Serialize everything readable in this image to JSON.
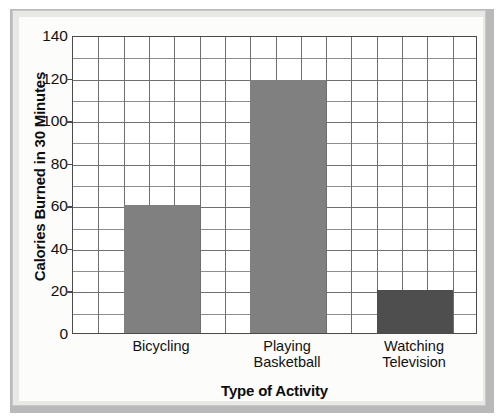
{
  "chart_data": {
    "type": "bar",
    "title": "",
    "subtitle": "",
    "categories": [
      "Bicycling",
      "Playing Basketball",
      "Watching Television"
    ],
    "category_lines": [
      [
        "Bicycling"
      ],
      [
        "Playing",
        "Basketball"
      ],
      [
        "Watching",
        "Television"
      ]
    ],
    "values": [
      60,
      119,
      20
    ],
    "xlabel": "Type of Activity",
    "ylabel": "Calories Burned in 30 Minutes",
    "ylim": [
      0,
      140
    ],
    "ytick_labels": [
      "0",
      "20",
      "40",
      "60",
      "80",
      "100",
      "120",
      "140"
    ],
    "ytick_values": [
      0,
      20,
      40,
      60,
      80,
      100,
      120,
      140
    ],
    "minor_ytick_values": [
      10,
      30,
      50,
      70,
      90,
      110,
      130
    ],
    "y_gridline_interval": 10,
    "x_gridline_count": 16,
    "grid": true,
    "legend": "none",
    "bar_colors": [
      "#808080",
      "#808080",
      "#4e4e4e"
    ],
    "bar_width_cells": 3,
    "bar_start_cells": [
      2,
      7,
      12
    ]
  },
  "colors": {
    "bar_light": "#808080",
    "bar_dark": "#4e4e4e",
    "axis": "#4a4a4a",
    "grid_major": "#6f6f6f",
    "grid_minor": "#8d8d8d",
    "plot_background": "#ffffff",
    "page_background": "#fcfcfa",
    "frame": "#e8e8e6",
    "text": "#111111"
  }
}
